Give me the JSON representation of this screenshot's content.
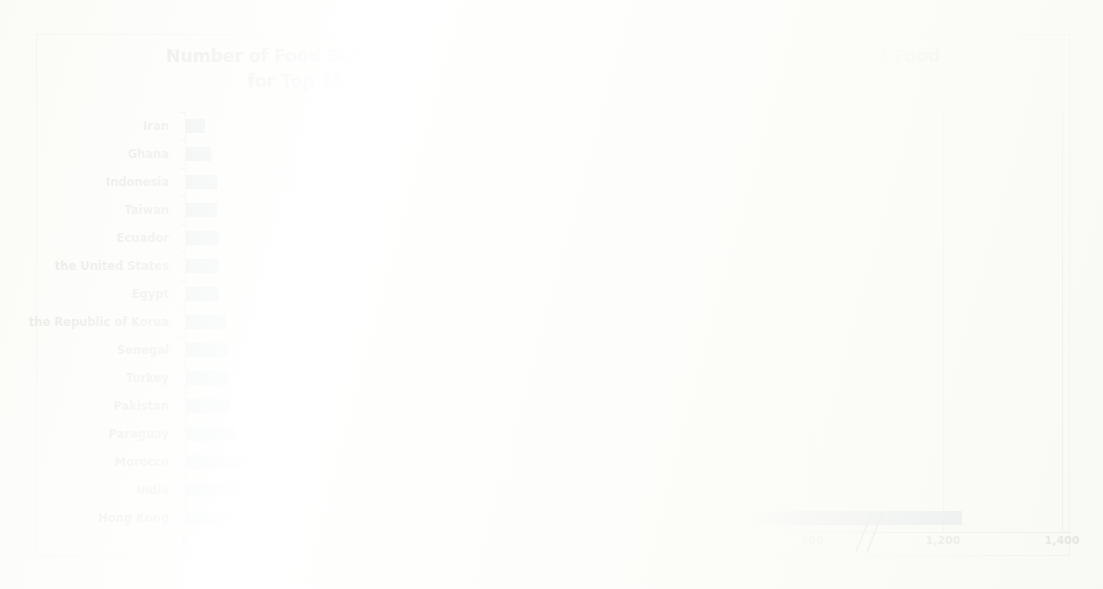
{
  "figure": {
    "title_line1": "Number of Food Safety Alert in EURASFF Divided by the Value of Imported Food",
    "title_line2": "for Top 15 Origin Countries (in 1,000,000,000 Euro), 2006-2010",
    "bar_color": "#3a6d9e",
    "grid_color": "#9a9a96",
    "axis_color": "#6f6f6b",
    "frame_color": "#b9b9b5"
  },
  "chart_data": {
    "type": "bar",
    "orientation": "horizontal",
    "title": "Number of Food Safety Alert in EURASFF Divided by the Value of Imported Food for Top 15 Origin Countries (in 1,000,000,000 Euro), 2006-2010",
    "xlabel": "",
    "ylabel": "",
    "categories": [
      "Iran",
      "Ghana",
      "Indonesia",
      "Taiwan",
      "Ecuador",
      "the United States",
      "Egypt",
      "the Republic of Korea",
      "Senegal",
      "Turkey",
      "Pakistan",
      "Paraguay",
      "Morocco",
      "India",
      "Hong Kong"
    ],
    "values": [
      9,
      12,
      15,
      15,
      16,
      16,
      16,
      19,
      20,
      20,
      21,
      23,
      82,
      210,
      1230
    ],
    "xticks": [
      "0",
      "50",
      "100",
      "150",
      "200",
      "250",
      "300",
      "1,200",
      "1,400"
    ],
    "xtick_values": [
      0,
      50,
      100,
      150,
      200,
      250,
      300,
      1200,
      1400
    ],
    "axis_break": true,
    "axis_break_between": [
      300,
      1200
    ],
    "xlim": [
      0,
      1400
    ],
    "grid": true,
    "grid_axis": "x",
    "legend": false
  }
}
